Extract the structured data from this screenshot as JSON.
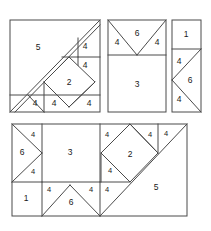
{
  "figure": {
    "stroke_color": "#4a4a4a",
    "fill_color": "#ffffff",
    "label_color": "#1a1a1a",
    "background": "#ffffff"
  },
  "panels": [
    {
      "name": "top-left-square",
      "x": 10,
      "y": 20,
      "width": 90,
      "height": 92,
      "pieces": [
        {
          "id": "tl-5",
          "label": "5",
          "shape": "large-triangle",
          "cx": 38,
          "cy": 48
        },
        {
          "id": "tl-4a",
          "label": "4",
          "shape": "small-triangle",
          "cx": 85,
          "cy": 47
        },
        {
          "id": "tl-4b",
          "label": "4",
          "shape": "small-triangle",
          "cx": 85,
          "cy": 65
        },
        {
          "id": "tl-2",
          "label": "2",
          "shape": "square-diamond",
          "cx": 69,
          "cy": 82
        },
        {
          "id": "tl-4c",
          "label": "4",
          "shape": "small-triangle",
          "cx": 38,
          "cy": 103
        },
        {
          "id": "tl-4d",
          "label": "4",
          "shape": "small-triangle",
          "cx": 54,
          "cy": 103
        },
        {
          "id": "tl-4e",
          "label": "4",
          "shape": "small-triangle",
          "cx": 88,
          "cy": 103
        }
      ]
    },
    {
      "name": "top-middle-rectangle",
      "x": 108,
      "y": 20,
      "width": 58,
      "height": 92,
      "pieces": [
        {
          "id": "tm-4a",
          "label": "4",
          "shape": "small-triangle",
          "cx": 117,
          "cy": 42
        },
        {
          "id": "tm-6",
          "label": "6",
          "shape": "medium-triangle",
          "cx": 137,
          "cy": 35
        },
        {
          "id": "tm-4b",
          "label": "4",
          "shape": "small-triangle",
          "cx": 156,
          "cy": 42
        },
        {
          "id": "tm-3",
          "label": "3",
          "shape": "square",
          "cx": 137,
          "cy": 84
        }
      ]
    },
    {
      "name": "top-right-rectangle",
      "x": 172,
      "y": 20,
      "width": 29,
      "height": 92,
      "pieces": [
        {
          "id": "tr-1",
          "label": "1",
          "shape": "square",
          "cx": 186,
          "cy": 36
        },
        {
          "id": "tr-4a",
          "label": "4",
          "shape": "small-triangle",
          "cx": 178,
          "cy": 62
        },
        {
          "id": "tr-6",
          "label": "6",
          "shape": "medium-triangle",
          "cx": 190,
          "cy": 80
        },
        {
          "id": "tr-4b",
          "label": "4",
          "shape": "small-triangle",
          "cx": 178,
          "cy": 98
        }
      ]
    },
    {
      "name": "bottom-rectangle",
      "x": 12,
      "y": 124,
      "width": 175,
      "height": 92,
      "pieces": [
        {
          "id": "bl-4a",
          "label": "4",
          "shape": "small-triangle",
          "cx": 33,
          "cy": 134
        },
        {
          "id": "bl-6",
          "label": "6",
          "shape": "medium-triangle",
          "cx": 22,
          "cy": 152
        },
        {
          "id": "bl-4b",
          "label": "4",
          "shape": "small-triangle",
          "cx": 33,
          "cy": 171
        },
        {
          "id": "bm-3",
          "label": "3",
          "shape": "square",
          "cx": 70,
          "cy": 152
        },
        {
          "id": "bl-1",
          "label": "1",
          "shape": "square",
          "cx": 26,
          "cy": 197
        },
        {
          "id": "bm-4a",
          "label": "4",
          "shape": "small-triangle",
          "cx": 49,
          "cy": 189
        },
        {
          "id": "bm-6",
          "label": "6",
          "shape": "medium-triangle",
          "cx": 70,
          "cy": 199
        },
        {
          "id": "bm-4b",
          "label": "4",
          "shape": "small-triangle",
          "cx": 91,
          "cy": 189
        },
        {
          "id": "br-4a",
          "label": "4",
          "shape": "small-triangle",
          "cx": 107,
          "cy": 189
        },
        {
          "id": "br-4b",
          "label": "4",
          "shape": "small-triangle",
          "cx": 107,
          "cy": 134
        },
        {
          "id": "br-2",
          "label": "2",
          "shape": "square-diamond",
          "cx": 130,
          "cy": 155
        },
        {
          "id": "br-4c",
          "label": "4",
          "shape": "small-triangle",
          "cx": 150,
          "cy": 134
        },
        {
          "id": "br-4d",
          "label": "4",
          "shape": "small-triangle",
          "cx": 166,
          "cy": 133
        },
        {
          "id": "br-4e",
          "label": "4",
          "shape": "small-triangle",
          "cx": 110,
          "cy": 170
        },
        {
          "id": "br-5",
          "label": "5",
          "shape": "large-triangle",
          "cx": 155,
          "cy": 186
        }
      ]
    }
  ],
  "labels": {
    "one": "1",
    "two": "2",
    "three": "3",
    "four": "4",
    "five": "5",
    "six": "6"
  }
}
